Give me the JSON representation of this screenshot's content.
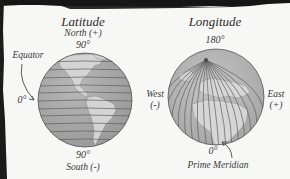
{
  "latitude_panel": {
    "title": "Latitude",
    "north_label": "North (+)",
    "north_degree": "90°",
    "equator_label": "Equator",
    "equator_degree": "0°",
    "south_degree": "90°",
    "south_label": "South (-)",
    "globe_icon": "globe-with-parallels-icon",
    "line_count": 11
  },
  "longitude_panel": {
    "title": "Longitude",
    "top_degree": "180°",
    "west_label": "West",
    "west_sign": "(-)",
    "east_label": "East",
    "east_sign": "(+)",
    "prime_degree": "0°",
    "prime_label": "Prime Meridian",
    "globe_icon": "globe-with-meridians-icon"
  },
  "colors": {
    "ocean": "#a9a9a9",
    "land": "#d3d3d3",
    "grid_lines": "#5a5a5a",
    "text": "#333333",
    "background": "#f7f7f5",
    "scan_border": "#161616"
  }
}
